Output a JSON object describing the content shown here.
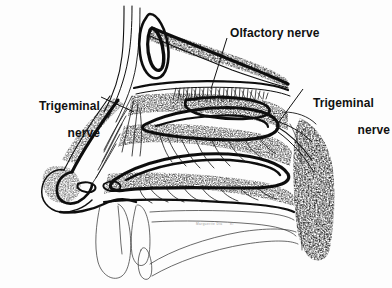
{
  "figure": {
    "background_color": "#fdfdfd",
    "ink_color": "#111111",
    "signature": "Marguerite Dia     '87"
  },
  "labels": {
    "olfactory": {
      "text": "Olfactory nerve",
      "x": 230,
      "y": 27
    },
    "trigeminal_left": {
      "line1": "Trigeminal",
      "line2": "nerve",
      "x": 12,
      "y": 86
    },
    "trigeminal_right": {
      "line1": "Trigeminal",
      "line2": "nerve",
      "x": 306,
      "y": 83
    }
  },
  "leader_lines": [
    {
      "name": "olfactory-leader",
      "from": [
        227,
        38
      ],
      "to": [
        211,
        89
      ]
    },
    {
      "name": "trigeminal-left-leader",
      "from": [
        101,
        97
      ],
      "to": [
        134,
        112
      ]
    },
    {
      "name": "trigeminal-right-leader",
      "from": [
        303,
        89
      ],
      "to": [
        276,
        126
      ]
    }
  ],
  "anatomy": [
    {
      "name": "frontal-sinus",
      "kind": "cavity"
    },
    {
      "name": "cribriform-plate",
      "kind": "bone"
    },
    {
      "name": "olfactory-epithelium-fibers",
      "kind": "nerve-tuft"
    },
    {
      "name": "superior-turbinate",
      "kind": "turbinate"
    },
    {
      "name": "middle-turbinate",
      "kind": "turbinate"
    },
    {
      "name": "inferior-turbinate",
      "kind": "turbinate"
    },
    {
      "name": "nasal-septum-mucosa",
      "kind": "soft-tissue"
    },
    {
      "name": "nose-tip",
      "kind": "cartilage"
    },
    {
      "name": "nostril",
      "kind": "opening"
    },
    {
      "name": "hard-palate",
      "kind": "bone"
    },
    {
      "name": "soft-palate",
      "kind": "soft-tissue"
    },
    {
      "name": "upper-lip",
      "kind": "soft-tissue"
    },
    {
      "name": "incisor-teeth",
      "kind": "tooth"
    },
    {
      "name": "tongue",
      "kind": "muscle"
    },
    {
      "name": "posterior-pharyngeal-wall",
      "kind": "soft-tissue"
    },
    {
      "name": "nasopharynx",
      "kind": "cavity"
    },
    {
      "name": "trigeminal-branches",
      "kind": "nerve-branches"
    }
  ]
}
